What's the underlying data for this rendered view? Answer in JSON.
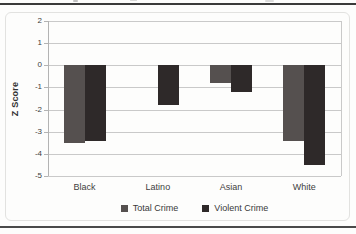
{
  "chart_data": {
    "type": "bar",
    "title": "",
    "ylabel": "Z Score",
    "xlabel": "",
    "categories": [
      "Black",
      "Latino",
      "Asian",
      "White"
    ],
    "series": [
      {
        "name": "Total Crime",
        "color": "#55504f",
        "values": [
          -3.5,
          0,
          -0.8,
          -3.4
        ]
      },
      {
        "name": "Violent Crime",
        "color": "#2e2929",
        "values": [
          -3.4,
          -1.8,
          -1.2,
          -4.5
        ]
      }
    ],
    "ylim": [
      -5,
      2
    ],
    "yticks": [
      2,
      1,
      0,
      -1,
      -2,
      -3,
      -4,
      -5
    ],
    "grid": true,
    "legend_position": "bottom",
    "grid_color": "#c9c9c9",
    "axis_color": "#b3b3b3",
    "text_color": "#3d3d3d"
  }
}
